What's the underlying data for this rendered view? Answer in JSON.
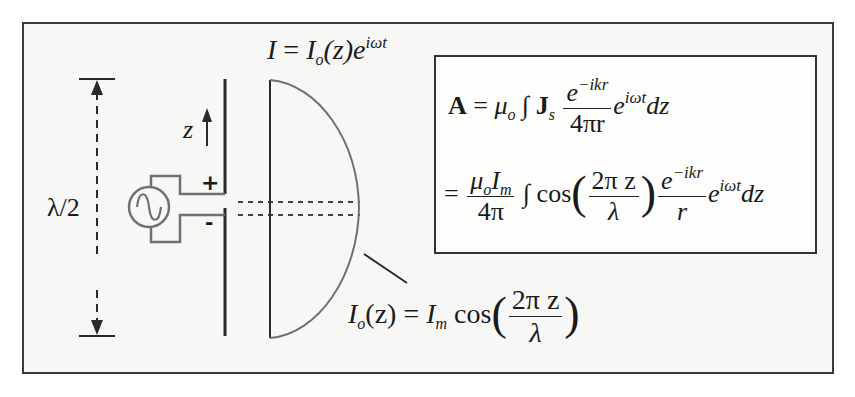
{
  "figure": {
    "title_equation": {
      "lhs": "I",
      "eq": "=",
      "rhs_main": "I",
      "rhs_sub": "o",
      "rhs_arg": "(z)e",
      "rhs_sup": "iωt"
    },
    "labels": {
      "half_wavelength": "λ/2",
      "z_axis": "z",
      "plus_terminal": "+",
      "minus_terminal": "-"
    },
    "distribution_equation": {
      "lhs": "I",
      "lhs_sub": "o",
      "lhs_arg": "(z)",
      "eq": "=",
      "amp": "I",
      "amp_sub": "m",
      "func": "cos",
      "num": "2π z",
      "den": "λ"
    },
    "equation_box": {
      "line1": {
        "lhs": "A",
        "eq": "=",
        "mu": "μ",
        "mu_sub": "o",
        "integral": "∫",
        "J": "J",
        "J_sub": "s",
        "frac_num_base": "e",
        "frac_num_sup": "−ikr",
        "frac_den": "4πr",
        "exp_base": "e",
        "exp_sup": "iωt",
        "diff": "dz"
      },
      "line2": {
        "eq": "=",
        "frac1_num_mu": "μ",
        "frac1_num_mu_sub": "o",
        "frac1_num_I": "I",
        "frac1_num_I_sub": "m",
        "frac1_den": "4π",
        "integral": "∫",
        "func": "cos",
        "frac2_num": "2π z",
        "frac2_den": "λ",
        "frac3_num_base": "e",
        "frac3_num_sup": "−ikr",
        "frac3_den": "r",
        "exp_base": "e",
        "exp_sup": "iωt",
        "diff": "dz"
      }
    },
    "colors": {
      "line": "#2a2a2a",
      "gray_line": "#707070",
      "frame_bg": "#f7f7f5"
    }
  }
}
